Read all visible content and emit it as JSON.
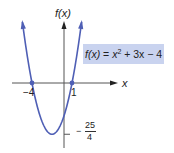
{
  "chart_data": {
    "type": "line",
    "title": "",
    "function_label": {
      "lhs": "f(x)",
      "equals": "=",
      "term1_base": "x",
      "term1_exp": "2",
      "rest": "+ 3x − 4"
    },
    "xlabel": "x",
    "ylabel": "f(x)",
    "coefficients": {
      "a": 1,
      "b": 3,
      "c": -4
    },
    "x_range": [
      -5.2,
      2.2
    ],
    "y_range": [
      -6.25,
      6.7
    ],
    "roots": [
      {
        "x": -4,
        "y": 0,
        "label": "−4"
      },
      {
        "x": 1,
        "y": 0,
        "label": "1"
      }
    ],
    "vertex": {
      "x": -1.5,
      "y": -6.25
    },
    "y_tick": {
      "value": -6.25,
      "label_sign": "−",
      "label_num": "25",
      "label_den": "4"
    },
    "grid": false,
    "colors": {
      "curve": "#4f5fb5",
      "axis": "#222222",
      "label_box": "#c9d3ef"
    }
  }
}
